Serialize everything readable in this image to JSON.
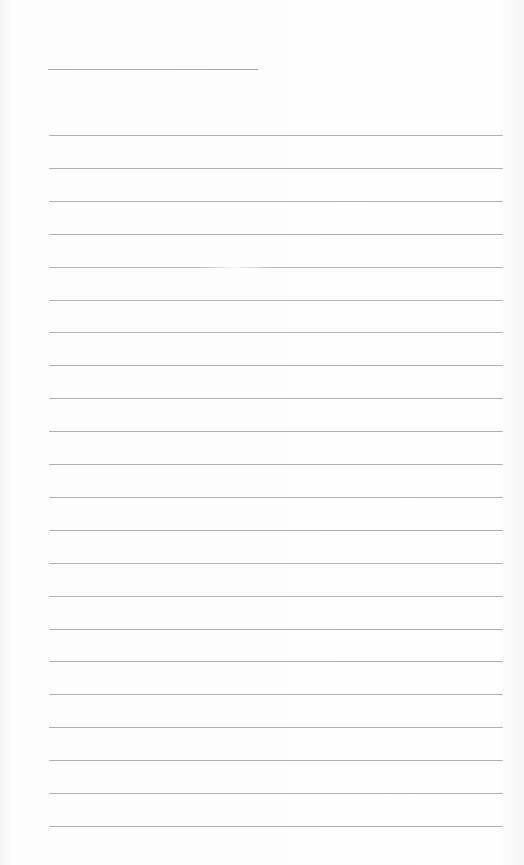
{
  "document": {
    "type": "lined-paper",
    "title_line": {
      "present": true,
      "text": ""
    },
    "rule_count": 22,
    "rule_color": "#b0b0b0",
    "background_color": "#fdfdfd",
    "lines": [
      "",
      "",
      "",
      "",
      "",
      "",
      "",
      "",
      "",
      "",
      "",
      "",
      "",
      "",
      "",
      "",
      "",
      "",
      "",
      "",
      "",
      ""
    ]
  }
}
